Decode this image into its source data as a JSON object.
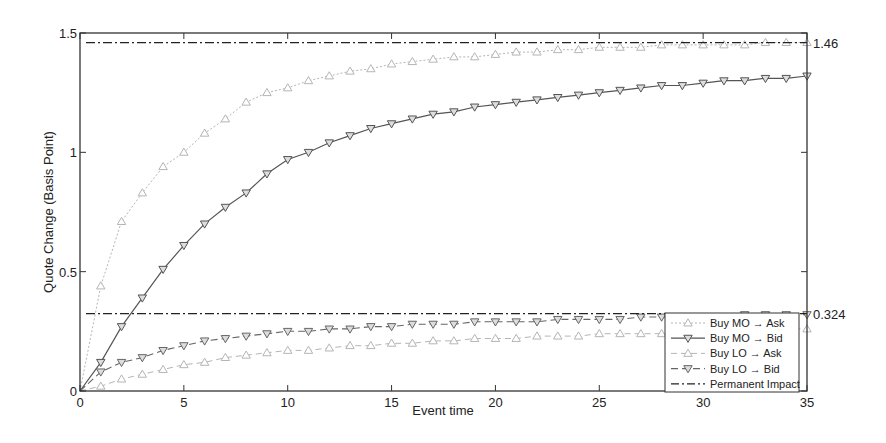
{
  "chart_data": {
    "type": "line",
    "title": "",
    "xlabel": "Event time",
    "ylabel": "Quote Change (Basis Point)",
    "xlim": [
      0,
      35
    ],
    "ylim": [
      0,
      1.5
    ],
    "xticks": [
      0,
      5,
      10,
      15,
      20,
      25,
      30,
      35
    ],
    "yticks": [
      0,
      0.5,
      1,
      1.5
    ],
    "xtick_labels": [
      "0",
      "5",
      "10",
      "15",
      "20",
      "25",
      "30",
      "35"
    ],
    "ytick_labels": [
      "0",
      "0.5",
      "1",
      "1.5"
    ],
    "grid": false,
    "legend_position": "lower right",
    "x": [
      0,
      1,
      2,
      3,
      4,
      5,
      6,
      7,
      8,
      9,
      10,
      11,
      12,
      13,
      14,
      15,
      16,
      17,
      18,
      19,
      20,
      21,
      22,
      23,
      24,
      25,
      26,
      27,
      28,
      29,
      30,
      31,
      32,
      33,
      34,
      35
    ],
    "series": [
      {
        "name": "Buy MO → Ask",
        "style": "dotted-light",
        "marker": "triangle-up",
        "color": "#b5b5b5",
        "values": [
          0,
          0.44,
          0.71,
          0.83,
          0.94,
          1.0,
          1.08,
          1.14,
          1.21,
          1.25,
          1.27,
          1.3,
          1.32,
          1.34,
          1.35,
          1.37,
          1.38,
          1.39,
          1.4,
          1.4,
          1.41,
          1.42,
          1.42,
          1.43,
          1.43,
          1.44,
          1.44,
          1.44,
          1.45,
          1.45,
          1.45,
          1.45,
          1.45,
          1.46,
          1.46,
          1.46
        ]
      },
      {
        "name": "Buy MO → Bid",
        "style": "solid",
        "marker": "triangle-down",
        "color": "#555555",
        "values": [
          0,
          0.12,
          0.27,
          0.39,
          0.51,
          0.61,
          0.7,
          0.77,
          0.83,
          0.91,
          0.97,
          1.0,
          1.04,
          1.07,
          1.1,
          1.12,
          1.14,
          1.16,
          1.17,
          1.19,
          1.2,
          1.21,
          1.22,
          1.23,
          1.24,
          1.25,
          1.26,
          1.27,
          1.28,
          1.28,
          1.29,
          1.3,
          1.3,
          1.31,
          1.31,
          1.32
        ]
      },
      {
        "name": "Buy LO → Ask",
        "style": "dashed-light",
        "marker": "triangle-up",
        "color": "#b5b5b5",
        "values": [
          0,
          0.02,
          0.05,
          0.07,
          0.09,
          0.11,
          0.12,
          0.14,
          0.15,
          0.16,
          0.17,
          0.17,
          0.18,
          0.19,
          0.19,
          0.2,
          0.2,
          0.21,
          0.21,
          0.22,
          0.22,
          0.22,
          0.23,
          0.23,
          0.23,
          0.24,
          0.24,
          0.24,
          0.24,
          0.25,
          0.25,
          0.25,
          0.25,
          0.25,
          0.26,
          0.26
        ]
      },
      {
        "name": "Buy LO → Bid",
        "style": "dashed",
        "marker": "triangle-down",
        "color": "#666666",
        "values": [
          0,
          0.08,
          0.12,
          0.14,
          0.17,
          0.19,
          0.21,
          0.22,
          0.23,
          0.24,
          0.25,
          0.25,
          0.26,
          0.26,
          0.27,
          0.27,
          0.28,
          0.28,
          0.28,
          0.29,
          0.29,
          0.29,
          0.29,
          0.3,
          0.3,
          0.3,
          0.3,
          0.31,
          0.31,
          0.31,
          0.31,
          0.31,
          0.32,
          0.32,
          0.32,
          0.32
        ]
      }
    ],
    "reference_lines": [
      {
        "name": "Permanent Impact",
        "y": 1.46,
        "label": "1.46",
        "style": "dash-dot",
        "color": "#222222"
      },
      {
        "name": "Permanent Impact",
        "y": 0.324,
        "label": "0.324",
        "style": "dash-dot",
        "color": "#222222"
      }
    ],
    "legend": [
      "Buy MO → Ask",
      "Buy MO → Bid",
      "Buy LO → Ask",
      "Buy LO → Bid",
      "Permanent Impact"
    ]
  }
}
